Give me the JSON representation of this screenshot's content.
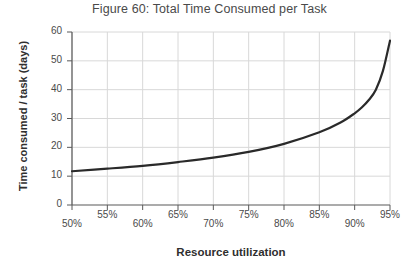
{
  "chart_data": {
    "type": "line",
    "title": "Figure 60: Total Time Consumed per Task",
    "xlabel": "Resource utilization",
    "ylabel": "Time consumed / task (days)",
    "xlim": [
      50,
      95
    ],
    "ylim": [
      0,
      60
    ],
    "grid": true,
    "legend": "none",
    "x_tick_labels": [
      "50%",
      "55%",
      "60%",
      "65%",
      "70%",
      "75%",
      "80%",
      "85%",
      "90%",
      "95%"
    ],
    "x_tick_values": [
      50,
      55,
      60,
      65,
      70,
      75,
      80,
      85,
      90,
      95
    ],
    "y_tick_labels": [
      "0",
      "10",
      "20",
      "30",
      "40",
      "50",
      "60"
    ],
    "y_tick_values": [
      0,
      10,
      20,
      30,
      40,
      50,
      60
    ],
    "series": [
      {
        "name": "Time consumed per task",
        "color": "#2a2a2a",
        "x": [
          50,
          55,
          60,
          65,
          70,
          75,
          80,
          85,
          88,
          90,
          91,
          92,
          93,
          94,
          95
        ],
        "values": [
          11.7,
          12.6,
          13.6,
          14.9,
          16.4,
          18.4,
          21.2,
          25.2,
          28.6,
          31.8,
          33.8,
          36.4,
          40.0,
          46.5,
          57.0
        ]
      }
    ]
  },
  "axis_style": {
    "grid_color": "#d8d8d8",
    "axis_color": "#595959",
    "line_color": "#2a2a2a",
    "text_color": "#4a4a4a"
  }
}
